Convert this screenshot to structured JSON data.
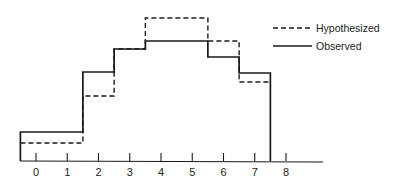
{
  "chart_data": {
    "type": "line",
    "subtype": "step-histogram",
    "title": "",
    "xlabel": "",
    "ylabel": "",
    "categories": [
      "0",
      "1",
      "2",
      "3",
      "4",
      "5",
      "6",
      "7"
    ],
    "x_ticks": [
      "0",
      "1",
      "2",
      "3",
      "4",
      "5",
      "6",
      "7",
      "8"
    ],
    "bin_edges": [
      -0.5,
      1.5,
      2.5,
      3.5,
      5.5,
      6.5,
      7.5
    ],
    "series": [
      {
        "name": "Hypothesized",
        "style": "dashed",
        "values": [
          18,
          18,
          65,
          112,
          143,
          143,
          120,
          79
        ]
      },
      {
        "name": "Observed",
        "style": "solid",
        "values": [
          29,
          29,
          89,
          112,
          120,
          120,
          104,
          88
        ]
      }
    ],
    "xlim": [
      -0.5,
      9.7
    ],
    "ylim": [
      0,
      150
    ],
    "y_axis_visible": false,
    "grid": false,
    "legend_position": "upper right",
    "colors": {
      "line": "#1a1a1a",
      "background": "#ffffff"
    }
  },
  "legend": {
    "items": [
      {
        "label": "Hypothesized",
        "style": "dashed"
      },
      {
        "label": "Observed",
        "style": "solid"
      }
    ]
  }
}
